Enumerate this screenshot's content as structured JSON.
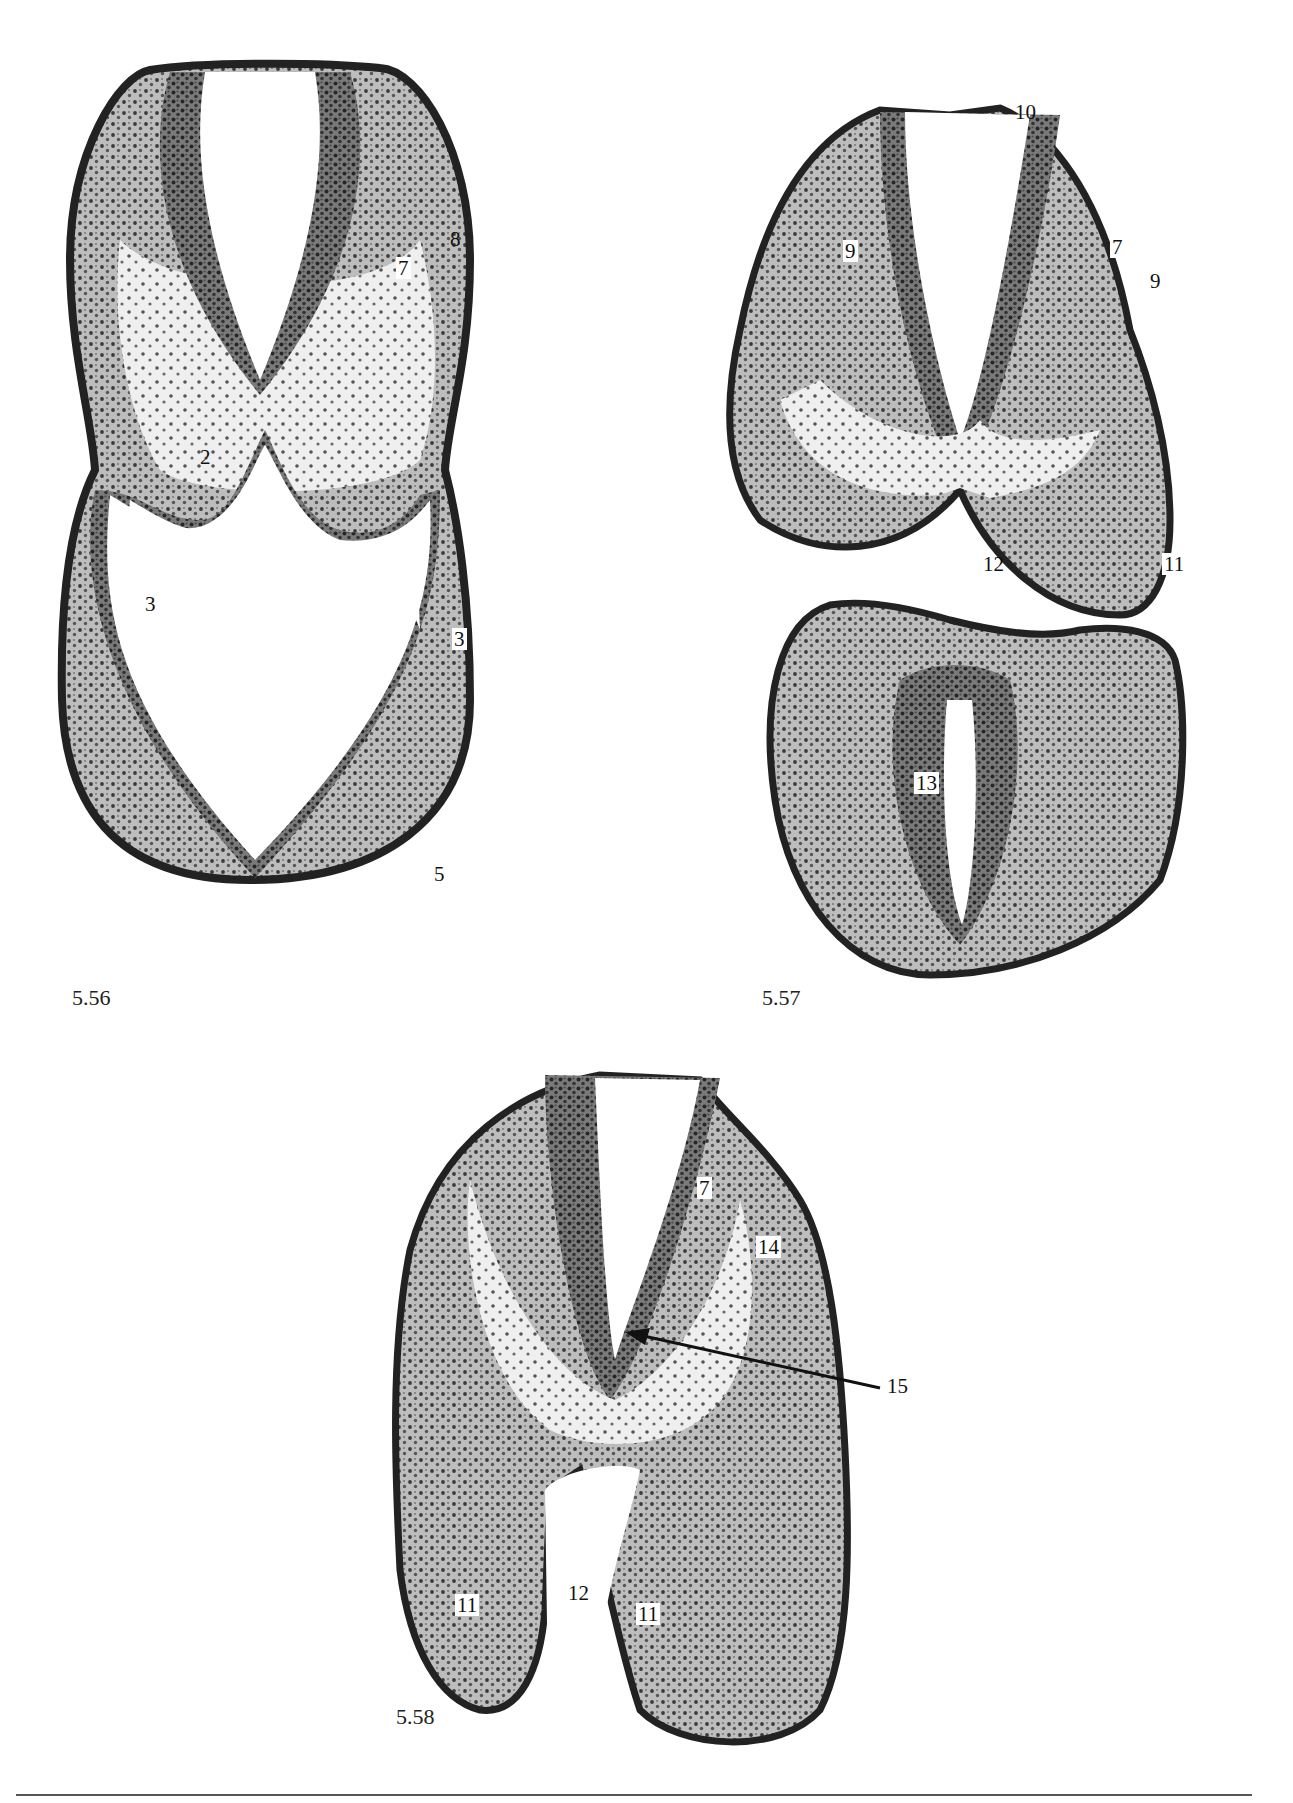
{
  "page": {
    "background": "#ffffff",
    "tissue_dark": "#2b2b2b",
    "tissue_mid": "#8a8a8a",
    "tissue_light": "#d6d6d6"
  },
  "figures": [
    {
      "id": "5.56",
      "number": "5.56",
      "labels": [
        {
          "text": "7",
          "boxed": true
        },
        {
          "text": "8",
          "boxed": false
        },
        {
          "text": "2",
          "boxed": false
        },
        {
          "text": "3",
          "boxed": true
        },
        {
          "text": "3",
          "boxed": true
        },
        {
          "text": "5",
          "boxed": true
        }
      ]
    },
    {
      "id": "5.57",
      "number": "5.57",
      "labels": [
        {
          "text": "10",
          "boxed": false
        },
        {
          "text": "9",
          "boxed": true
        },
        {
          "text": "7",
          "boxed": true
        },
        {
          "text": "9",
          "boxed": true
        },
        {
          "text": "12",
          "boxed": false
        },
        {
          "text": "11",
          "boxed": true
        },
        {
          "text": "13",
          "boxed": true
        }
      ]
    },
    {
      "id": "5.58",
      "number": "5.58",
      "labels": [
        {
          "text": "7",
          "boxed": true
        },
        {
          "text": "14",
          "boxed": true
        },
        {
          "text": "15",
          "boxed": false
        },
        {
          "text": "12",
          "boxed": false
        },
        {
          "text": "11",
          "boxed": true
        },
        {
          "text": "11",
          "boxed": true
        }
      ]
    }
  ]
}
